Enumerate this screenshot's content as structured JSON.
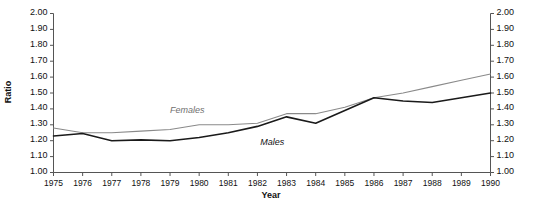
{
  "chart_data": {
    "type": "line",
    "title": "",
    "xlabel": "Year",
    "ylabel": "Ratio",
    "ylabel_right": "Ratio",
    "x": [
      1975,
      1976,
      1977,
      1978,
      1979,
      1980,
      1981,
      1982,
      1983,
      1984,
      1985,
      1986,
      1987,
      1988,
      1989,
      1990
    ],
    "categories": [
      "1975",
      "1976",
      "1977",
      "1978",
      "1979",
      "1980",
      "1981",
      "1982",
      "1983",
      "1984",
      "1985",
      "1986",
      "1987",
      "1988",
      "1989",
      "1990"
    ],
    "xlim": [
      1975,
      1990
    ],
    "ylim": [
      1.0,
      2.0
    ],
    "ytick_values": [
      2.0,
      1.9,
      1.8,
      1.7,
      1.6,
      1.5,
      1.4,
      1.3,
      1.2,
      1.1,
      1.0
    ],
    "ytick_labels": [
      "2.00",
      "1.90",
      "1.80",
      "1.70",
      "1.60",
      "1.50",
      "1.40",
      "1.30",
      "1.20",
      "1.10",
      "1.00"
    ],
    "ytick_labels_right": [
      "2.00",
      "1.90",
      "1.80",
      "1.70",
      "1.60",
      "1.50",
      "1.40",
      "1.30",
      "1.20",
      "1.10",
      "1.00"
    ],
    "grid": false,
    "legend_position": "inline-annotation",
    "series": [
      {
        "name": "Females",
        "color": "#8a8a8a",
        "width": 1.1,
        "label_x": 1979.0,
        "label_y": 1.385,
        "values": [
          1.28,
          1.25,
          1.25,
          1.26,
          1.27,
          1.3,
          1.3,
          1.31,
          1.37,
          1.37,
          1.41,
          1.47,
          1.5,
          1.54,
          1.58,
          1.62
        ]
      },
      {
        "name": "Males",
        "color": "#1a1a1a",
        "width": 1.6,
        "label_x": 1982.1,
        "label_y": 1.185,
        "values": [
          1.23,
          1.245,
          1.2,
          1.205,
          1.2,
          1.22,
          1.25,
          1.29,
          1.35,
          1.31,
          1.39,
          1.47,
          1.45,
          1.44,
          1.47,
          1.5
        ]
      }
    ]
  }
}
